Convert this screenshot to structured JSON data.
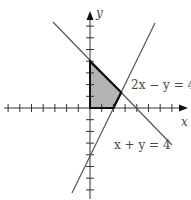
{
  "diagram": {
    "type": "linear-inequality-feasible-region",
    "axes": {
      "x_label": "x",
      "y_label": "y",
      "x_ticks": [
        -7,
        -6,
        -5,
        -4,
        -3,
        -2,
        -1,
        1,
        2,
        3,
        4,
        5,
        6,
        7
      ],
      "y_ticks": [
        -7,
        -6,
        -5,
        -4,
        -3,
        -2,
        -1,
        1,
        2,
        3,
        4,
        5,
        6,
        7
      ]
    },
    "lines": [
      {
        "equation": "2x − y = 4",
        "label": "2x − y = 4"
      },
      {
        "equation": "x + y = 4",
        "label": "x + y = 4"
      }
    ],
    "shaded_region": {
      "vertices": [
        [
          0,
          0
        ],
        [
          0,
          4
        ],
        [
          2.667,
          1.333
        ],
        [
          2,
          0
        ]
      ],
      "fill": "#b3b3b3"
    },
    "colors": {
      "axis": "#333333",
      "line": "#555555",
      "region_border": "#111111",
      "region_fill": "#b3b3b3",
      "text": "#4a4a4a"
    }
  }
}
